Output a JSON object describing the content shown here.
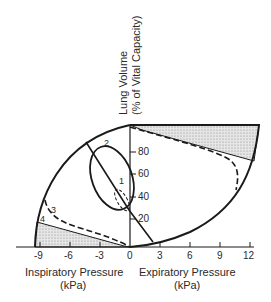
{
  "figure": {
    "y_axis": {
      "title_line1": "Lung Volume",
      "title_line2": "(% of Vital Capacity)",
      "ticks": [
        "20",
        "40",
        "60",
        "80"
      ]
    },
    "x_axis": {
      "ticks": [
        "-9",
        "-6",
        "-3",
        "0",
        "3",
        "6",
        "9",
        "12"
      ],
      "left_title_line1": "Inspiratory Pressure",
      "left_title_line2": "(kPa)",
      "right_title_line1": "Expiratory Pressure",
      "right_title_line2": "(kPa)"
    },
    "curve_labels": [
      "1",
      "2",
      "3",
      "4"
    ],
    "colors": {
      "line": "#1a1a1a",
      "shade": "#bdbdbd",
      "background": "#ffffff"
    }
  }
}
